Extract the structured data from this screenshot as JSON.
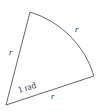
{
  "diagram": {
    "labels": {
      "left_side": "r",
      "arc": "r",
      "bottom_side": "r",
      "angle": "1 rad"
    },
    "colors": {
      "stroke": "#555555",
      "text": "#333333"
    }
  }
}
